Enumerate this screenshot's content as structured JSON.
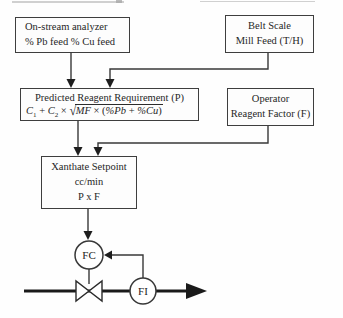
{
  "meta": {
    "background": "#fefefe",
    "ink_color": "#262626",
    "line_color": "#383838",
    "flow_line_color": "#1a1a1a"
  },
  "boxes": {
    "analyzer": {
      "line1": "On-stream analyzer",
      "line2": "% Pb feed % Cu feed"
    },
    "belt_scale": {
      "line1": "Belt Scale",
      "line2": "Mill Feed (T/H)"
    },
    "predicted": {
      "title": "Predicted Reagent Requirement (P)",
      "formula": {
        "coef1": "C",
        "coef1_sub": "1",
        "op_plus": " + ",
        "coef2": "C",
        "coef2_sub": "2",
        "op_times": " × ",
        "radical": "√",
        "rad_mf": "MF",
        "rad_times": " × (",
        "rad_pb": "%Pb",
        "rad_plus": " + ",
        "rad_cu": "%Cu",
        "rad_close": ")"
      }
    },
    "operator": {
      "line1": "Operator",
      "line2": "Reagent Factor (F)"
    },
    "xanthate": {
      "line1": "Xanthate Setpoint",
      "line2": "cc/min",
      "line3": "P x F"
    }
  },
  "instruments": {
    "flow_controller": "FC",
    "flow_indicator": "FI"
  }
}
